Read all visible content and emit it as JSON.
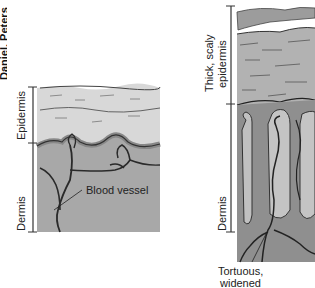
{
  "figure": {
    "edge_label_partial": "Daniel, Peters",
    "left_panel": {
      "name": "Normal skin",
      "labels": {
        "epidermis": "Epidermis",
        "dermis": "Dermis",
        "blood_vessel": "Blood vessel"
      }
    },
    "right_panel": {
      "name": "Psoriatic skin",
      "labels": {
        "epidermis": "Thick, scaly epidermis",
        "epidermis_line1": "Thick, scaly",
        "epidermis_line2": "epidermis",
        "dermis": "Dermis",
        "vessel_line1": "Tortuous,",
        "vessel_line2": "widened"
      }
    },
    "colors": {
      "epidermis_light": "#d6d6d6",
      "dermis": "#a9a9a9",
      "thick_epidermis": "#b0b0b0",
      "vessel_stroke": "#2a2a2a",
      "scale": "#9c9c9c"
    }
  }
}
